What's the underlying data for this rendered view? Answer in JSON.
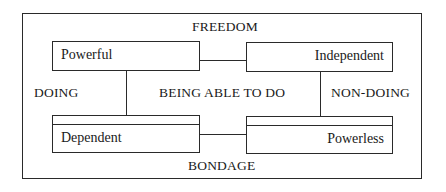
{
  "diagram": {
    "type": "box-diagram",
    "captions": {
      "top": "FREEDOM",
      "bottom": "BONDAGE",
      "left": "DOING",
      "center": "BEING ABLE TO DO",
      "right": "NON-DOING"
    },
    "boxes": {
      "top_left": {
        "label": "Powerful",
        "style": "single"
      },
      "top_right": {
        "label": "Independent",
        "style": "single"
      },
      "bottom_left": {
        "label": "Dependent",
        "style": "double-top"
      },
      "bottom_right": {
        "label": "Powerless",
        "style": "double-top"
      }
    },
    "connections": [
      {
        "from": "Powerful",
        "to": "Independent",
        "orientation": "horizontal"
      },
      {
        "from": "Dependent",
        "to": "Powerless",
        "orientation": "horizontal"
      },
      {
        "from": "Powerful",
        "to": "Dependent",
        "orientation": "vertical"
      },
      {
        "from": "Independent",
        "to": "Powerless",
        "orientation": "vertical"
      }
    ],
    "colors": {
      "line": "#2a2a2a",
      "text": "#1a1a1a",
      "background": "#ffffff"
    }
  }
}
